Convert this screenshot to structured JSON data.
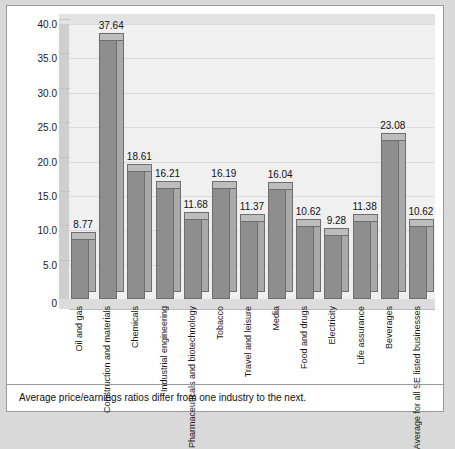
{
  "caption": "Average price/earnings ratios differ from one industry to the next.",
  "chart_data": {
    "type": "bar",
    "title": "",
    "xlabel": "",
    "ylabel": "",
    "ylim": [
      0,
      40
    ],
    "yticks": [
      0,
      5,
      10,
      15,
      20,
      25,
      30,
      35,
      40
    ],
    "ytick_labels": [
      "0",
      "5.0",
      "10.0",
      "15.0",
      "20.0",
      "25.0",
      "30.0",
      "35.0",
      "40.0"
    ],
    "grid": true,
    "legend": "none",
    "style": "3d-column",
    "bar_color": "#8e8e8e",
    "categories": [
      "Oil and gas",
      "Construction and materials",
      "Chemicals",
      "Industrial engineering",
      "Pharmaceuticals and biotechnology",
      "Tobacco",
      "Travel and leisure",
      "Media",
      "Food and drugs",
      "Electricity",
      "Life assurance",
      "Beverages",
      "Average for all SE listed businesses"
    ],
    "values": [
      8.77,
      37.64,
      18.61,
      16.21,
      11.68,
      16.19,
      11.37,
      16.04,
      10.62,
      9.28,
      11.38,
      23.08,
      10.62
    ],
    "value_labels": [
      "8.77",
      "37.64",
      "18.61",
      "16.21",
      "11.68",
      "16.19",
      "11.37",
      "16.04",
      "10.62",
      "9.28",
      "11.38",
      "23.08",
      "10.62"
    ]
  }
}
